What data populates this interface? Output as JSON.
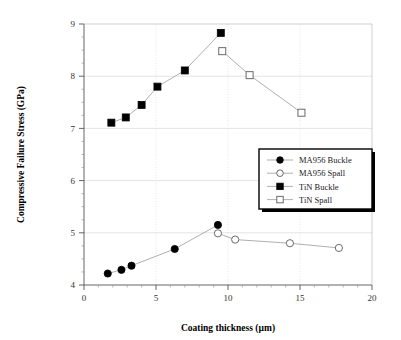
{
  "chart_data": {
    "type": "scatter",
    "title": "",
    "xlabel": "Coating thickness (µm)",
    "ylabel": "Compressive Failure Stress (GPa)",
    "xlim": [
      0,
      20
    ],
    "ylim": [
      4,
      9
    ],
    "xticks": [
      0,
      5,
      10,
      15,
      20
    ],
    "xtick_labels": [
      "0",
      "5",
      "10",
      "15",
      "20"
    ],
    "yticks": [
      4,
      5,
      6,
      7,
      8,
      9
    ],
    "ytick_labels": [
      "4",
      "5",
      "6",
      "7",
      "8",
      "9"
    ],
    "x_minor_interval": 1,
    "y_minor_interval": 0.25,
    "grid": true,
    "grid_color": "#d9d9d9",
    "legend_position": "center-right",
    "series": [
      {
        "name": "MA956 Buckle",
        "marker": "filled-circle",
        "color": "#000000",
        "line": true,
        "points": [
          {
            "x": 1.65,
            "y": 4.22
          },
          {
            "x": 2.6,
            "y": 4.29
          },
          {
            "x": 3.3,
            "y": 4.37
          },
          {
            "x": 6.3,
            "y": 4.69
          },
          {
            "x": 9.3,
            "y": 5.15
          }
        ]
      },
      {
        "name": "MA956 Spall",
        "marker": "open-circle",
        "color": "#000000",
        "line": true,
        "points": [
          {
            "x": 9.3,
            "y": 4.99
          },
          {
            "x": 10.5,
            "y": 4.87
          },
          {
            "x": 14.3,
            "y": 4.8
          },
          {
            "x": 17.7,
            "y": 4.71
          }
        ]
      },
      {
        "name": "TiN Buckle",
        "marker": "filled-square",
        "color": "#000000",
        "line": true,
        "points": [
          {
            "x": 1.9,
            "y": 7.11
          },
          {
            "x": 2.9,
            "y": 7.21
          },
          {
            "x": 4.0,
            "y": 7.45
          },
          {
            "x": 5.1,
            "y": 7.8
          },
          {
            "x": 7.0,
            "y": 8.11
          },
          {
            "x": 9.5,
            "y": 8.83
          }
        ]
      },
      {
        "name": "TiN Spall",
        "marker": "open-square",
        "color": "#000000",
        "line": true,
        "points": [
          {
            "x": 9.6,
            "y": 8.48
          },
          {
            "x": 11.5,
            "y": 8.02
          },
          {
            "x": 15.1,
            "y": 7.3
          }
        ]
      }
    ]
  },
  "legend": {
    "items": [
      {
        "label": "MA956 Buckle",
        "marker": "filled-circle"
      },
      {
        "label": "MA956 Spall",
        "marker": "open-circle"
      },
      {
        "label": "TiN Buckle",
        "marker": "filled-square"
      },
      {
        "label": "TiN Spall",
        "marker": "open-square"
      }
    ]
  }
}
